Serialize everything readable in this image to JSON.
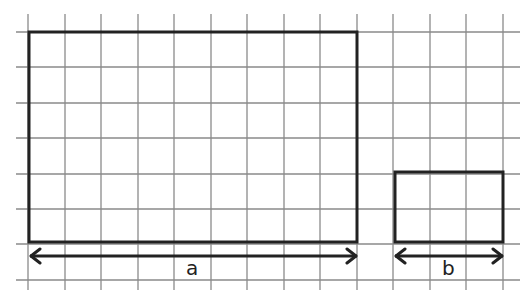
{
  "diagram": {
    "grid": {
      "x_start": 16,
      "x_end": 520,
      "y_start": 14,
      "y_end": 290,
      "vlines": [
        28,
        65,
        101,
        138,
        174,
        211,
        247,
        284,
        320,
        357,
        393,
        430,
        466,
        503
      ],
      "hlines": [
        32,
        67,
        103,
        138,
        174,
        209,
        244,
        280
      ],
      "color": "#8a8a8a"
    },
    "rectangles": [
      {
        "id": "large",
        "x": 29,
        "y": 32,
        "w": 328,
        "h": 210
      },
      {
        "id": "small",
        "x": 395,
        "y": 172,
        "w": 108,
        "h": 70
      }
    ],
    "arrows": [
      {
        "label": "a",
        "x1": 30,
        "x2": 357,
        "y": 256
      },
      {
        "label": "b",
        "x1": 395,
        "x2": 503,
        "y": 256
      }
    ],
    "labels": {
      "a": "a",
      "b": "b"
    },
    "stroke_color": "#222222"
  }
}
